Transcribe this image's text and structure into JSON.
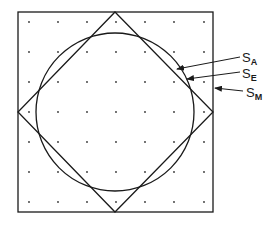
{
  "diagram": {
    "outer_square": {
      "x": 18,
      "y": 12,
      "width": 195,
      "height": 200
    },
    "diamond": {
      "top": [
        115,
        12
      ],
      "right": [
        213,
        112
      ],
      "bottom": [
        115,
        212
      ],
      "left": [
        18,
        112
      ]
    },
    "circle": {
      "cx": 115,
      "cy": 112,
      "r": 79
    },
    "grid_dots": {
      "x": [
        29,
        58,
        87,
        116,
        145,
        174,
        204
      ],
      "y": [
        22,
        52,
        82,
        112,
        142,
        172,
        202
      ]
    },
    "stroke_color": "#1a1a1a"
  },
  "labels": [
    {
      "id": "SA",
      "main": "S",
      "sub": "A",
      "x": 242,
      "y": 51,
      "arrow_from": [
        240,
        57
      ],
      "arrow_to": [
        177,
        69
      ]
    },
    {
      "id": "SE",
      "main": "S",
      "sub": "E",
      "x": 242,
      "y": 67,
      "arrow_from": [
        240,
        72
      ],
      "arrow_to": [
        187,
        79
      ]
    },
    {
      "id": "SM",
      "main": "S",
      "sub": "M",
      "x": 246,
      "y": 86,
      "arrow_from": [
        243,
        91
      ],
      "arrow_to": [
        215,
        88
      ]
    }
  ]
}
